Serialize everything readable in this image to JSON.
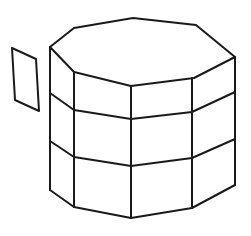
{
  "figure": {
    "kind": "line-drawing",
    "background_color": "#ffffff",
    "stroke_color": "#1a1a1a",
    "stroke_width": 2,
    "canvas": {
      "width": 251,
      "height": 236
    },
    "objects": [
      {
        "name": "detached-panel",
        "shape": "parallelogram",
        "description": "small quadrilateral panel floating to the left of the prism",
        "points": "12,48 36,59 39,111 15,100"
      },
      {
        "name": "octagonal-prism",
        "shape": "octagonal-prism",
        "tiers": 3,
        "visible_side_faces": 5,
        "description": "upright octagonal prism drawn in perspective, top face visible, body divided into three horizontal tiers"
      }
    ],
    "geometry": {
      "top_face_points": "50,47 74,28 133,18 196,25 235,57 194,78 131,86 74,72",
      "tier_lines": [
        {
          "name": "tier-line-1",
          "points": "50,93 74,110 131,119 192,112 235,92"
        },
        {
          "name": "tier-line-2",
          "points": "50,141 74,157 131,166 192,158 235,139"
        }
      ],
      "bottom_edge_points": "50,190 74,207 131,218 192,208 235,185",
      "vertical_edges": [
        {
          "name": "vertical-edge-left",
          "x1": 50,
          "y1": 47,
          "x2": 50,
          "y2": 190
        },
        {
          "name": "vertical-edge-left-inner",
          "x1": 74,
          "y1": 72,
          "x2": 74,
          "y2": 207
        },
        {
          "name": "vertical-edge-center",
          "x1": 131,
          "y1": 86,
          "x2": 131,
          "y2": 218
        },
        {
          "name": "vertical-edge-right-inner",
          "x1": 192,
          "y1": 78,
          "x2": 192,
          "y2": 208
        },
        {
          "name": "vertical-edge-right",
          "x1": 235,
          "y1": 57,
          "x2": 235,
          "y2": 185
        }
      ]
    }
  }
}
